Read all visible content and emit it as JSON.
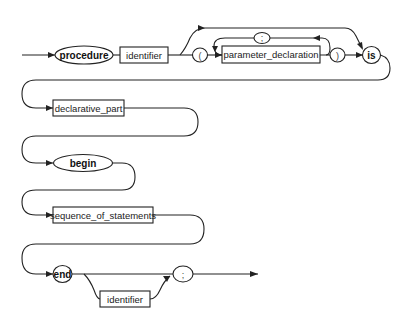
{
  "diagram": {
    "type": "syntax-railroad",
    "rows": [
      {
        "nodes": [
          {
            "id": "procedure",
            "kind": "keyword",
            "label": "procedure"
          },
          {
            "id": "identifier1",
            "kind": "nonterminal",
            "label": "identifier"
          },
          {
            "id": "lparen",
            "kind": "symbol",
            "label": "("
          },
          {
            "id": "parameter_declaration",
            "kind": "nonterminal",
            "label": "parameter_declaration"
          },
          {
            "id": "separator",
            "kind": "symbol",
            "label": ";"
          },
          {
            "id": "rparen",
            "kind": "symbol",
            "label": ")"
          },
          {
            "id": "is",
            "kind": "keyword",
            "label": "is"
          }
        ]
      },
      {
        "nodes": [
          {
            "id": "declarative_part",
            "kind": "nonterminal",
            "label": "declarative_part"
          }
        ]
      },
      {
        "nodes": [
          {
            "id": "begin",
            "kind": "keyword",
            "label": "begin"
          }
        ]
      },
      {
        "nodes": [
          {
            "id": "sequence_of_statements",
            "kind": "nonterminal",
            "label": "sequence_of_statements"
          }
        ]
      },
      {
        "nodes": [
          {
            "id": "end",
            "kind": "keyword",
            "label": "end"
          },
          {
            "id": "identifier2",
            "kind": "nonterminal",
            "label": "identifier"
          },
          {
            "id": "terminator",
            "kind": "symbol",
            "label": ";"
          }
        ]
      }
    ],
    "edges": [
      [
        "start",
        "procedure"
      ],
      [
        "procedure",
        "identifier1"
      ],
      [
        "identifier1",
        "lparen"
      ],
      [
        "identifier1",
        "is"
      ],
      [
        "lparen",
        "parameter_declaration"
      ],
      [
        "parameter_declaration",
        "separator"
      ],
      [
        "separator",
        "parameter_declaration"
      ],
      [
        "parameter_declaration",
        "rparen"
      ],
      [
        "rparen",
        "is"
      ],
      [
        "is",
        "declarative_part"
      ],
      [
        "declarative_part",
        "begin"
      ],
      [
        "begin",
        "sequence_of_statements"
      ],
      [
        "sequence_of_statements",
        "end"
      ],
      [
        "end",
        "identifier2"
      ],
      [
        "end",
        "terminator"
      ],
      [
        "identifier2",
        "terminator"
      ],
      [
        "terminator",
        "exit"
      ]
    ],
    "colors": {
      "stroke": "#222222",
      "background": "#ffffff"
    }
  }
}
